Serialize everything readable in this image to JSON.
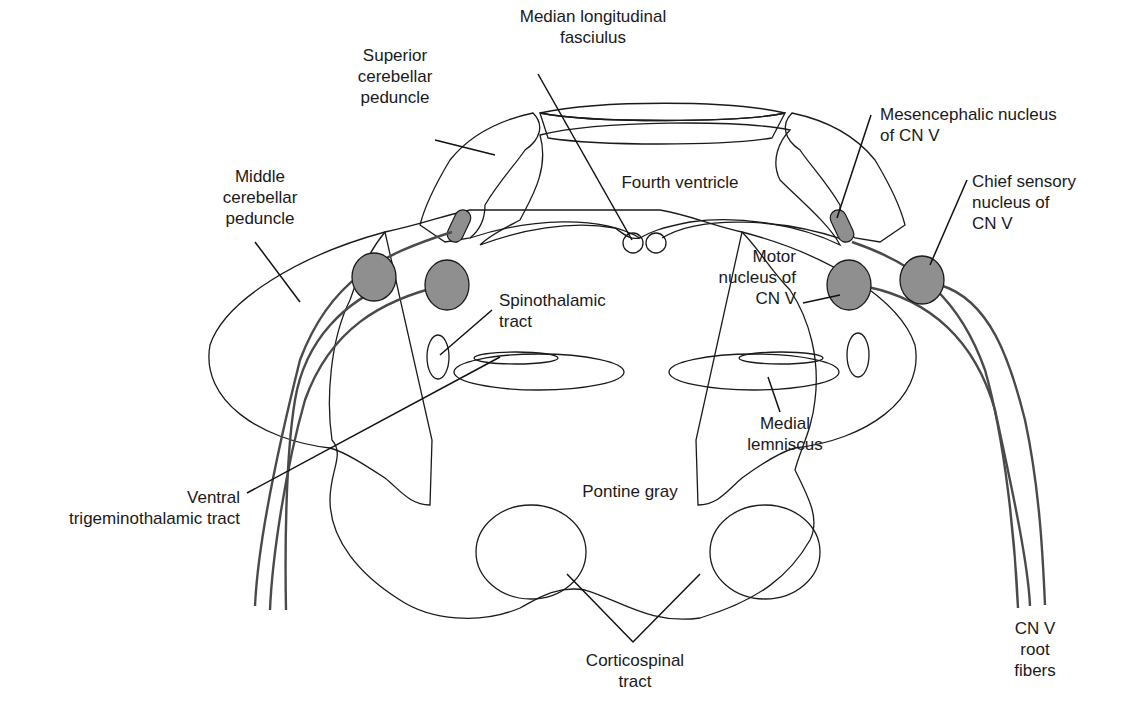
{
  "figure": {
    "colors": {
      "background": "#ffffff",
      "tegmentum_fill": "#ececec",
      "ventricle_fill": "#d9d9d9",
      "nucleus_fill": "#8f8f8f",
      "fiber_stroke": "#4a4a4a",
      "outline": "#1a1a1a"
    }
  },
  "labels": {
    "mlf": "Median longitudinal\nfasciulus",
    "superior_cerebellar_peduncle": "Superior\ncerebellar\npeduncle",
    "middle_cerebellar_peduncle": "Middle\ncerebellar\npeduncle",
    "fourth_ventricle": "Fourth ventricle",
    "mesencephalic_nucleus": "Mesencephalic nucleus\nof CN V",
    "chief_sensory_nucleus": "Chief sensory\nnucleus of\nCN V",
    "motor_nucleus": "Motor\nnucleus of\nCN V",
    "spinothalamic_tract": "Spinothalamic\ntract",
    "medial_lemniscus": "Medial\nlemniscus",
    "ventral_trigeminothalamic_tract": "Ventral\ntrigeminothalamic tract",
    "pontine_gray": "Pontine gray",
    "corticospinal_tract": "Corticospinal\ntract",
    "cn_v_root_fibers": "CN V\nroot\nfibers"
  }
}
